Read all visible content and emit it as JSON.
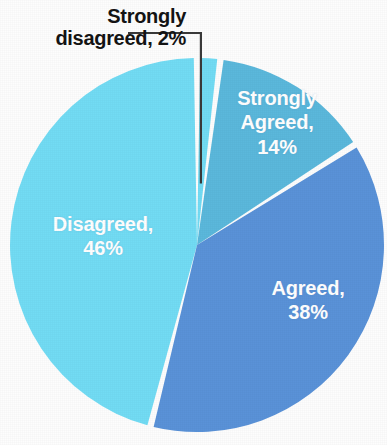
{
  "chart_data": {
    "type": "pie",
    "title": "",
    "subtitle": "",
    "xlabel": "",
    "ylabel": "",
    "legend_position": "none",
    "grid": false,
    "label_unit": "%",
    "categories": [
      "Strongly disagreed",
      "Strongly Agreed",
      "Agreed",
      "Disagreed"
    ],
    "values": [
      2,
      14,
      38,
      46
    ],
    "total": 100,
    "slices": [
      {
        "name": "Strongly disagreed",
        "label_text": "Strongly\ndisagreed, 2%",
        "value": 2,
        "value_text": "2%",
        "color": "#72DCF4",
        "label_placement": "outside",
        "label_color": "#141414",
        "start_angle_deg": 0,
        "end_angle_deg": 7.2
      },
      {
        "name": "Strongly Agreed",
        "label_text": "Strongly\nAgreed,\n14%",
        "value": 14,
        "value_text": "14%",
        "color": "#5BB8DC",
        "label_placement": "inside",
        "label_color": "#FFFFFF",
        "start_angle_deg": 7.2,
        "end_angle_deg": 57.6
      },
      {
        "name": "Agreed",
        "label_text": "Agreed,\n38%",
        "value": 38,
        "value_text": "38%",
        "color": "#5A92D8",
        "label_placement": "inside",
        "label_color": "#FFFFFF",
        "start_angle_deg": 57.6,
        "end_angle_deg": 194.4
      },
      {
        "name": "Disagreed",
        "label_text": "Disagreed,\n46%",
        "value": 46,
        "value_text": "46%",
        "color": "#72DCF4",
        "label_placement": "inside",
        "label_color": "#FFFFFF",
        "start_angle_deg": 194.4,
        "end_angle_deg": 360
      }
    ]
  },
  "figure": {
    "background_color": "#FDFDFD",
    "separator_color": "#FFFFFF",
    "leader_line_color": "#3A3A3A"
  }
}
